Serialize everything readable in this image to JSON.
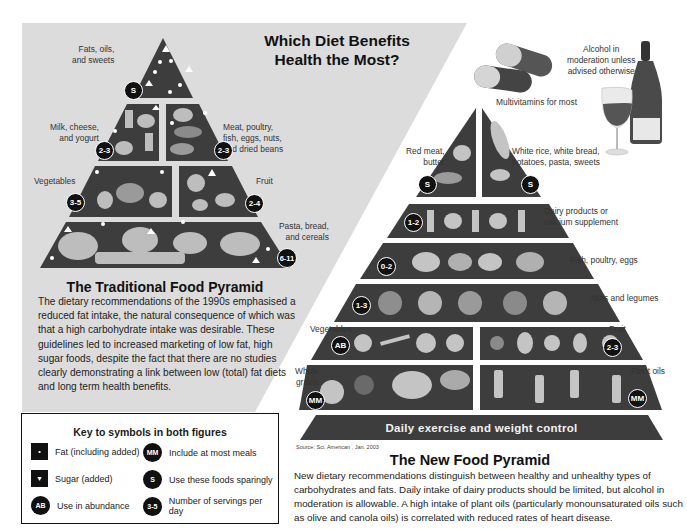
{
  "title": "Which Diet Benefits Health the Most?",
  "title_lines": [
    "Which Diet Benefits",
    "Health the Most?"
  ],
  "traditional": {
    "heading": "The Traditional Food Pyramid",
    "description": "The dietary recommendations of the 1990s emphasised a reduced fat intake, the natural consequence of which was that a high carbohydrate intake was desirable. These guidelines led to increased marketing of low fat, high sugar foods, despite the fact that there are no studies clearly demonstrating a link between low (total) fat diets and long term health benefits.",
    "tiers": [
      {
        "label": "Fats, oils,\nand sweets",
        "badge": "S"
      },
      {
        "label": "Milk, cheese,\nand yogurt",
        "badge": "2-3"
      },
      {
        "label": "Meat, poultry,\nfish, eggs, nuts,\nand dried beans",
        "badge": "2-3"
      },
      {
        "label": "Vegetables",
        "badge": "3-5"
      },
      {
        "label": "Fruit",
        "badge": "2-4"
      },
      {
        "label": "Pasta, bread,\nand cereals",
        "badge": "6-11"
      }
    ]
  },
  "new": {
    "heading": "The New Food Pyramid",
    "description": "New dietary recommendations distinguish between healthy and unhealthy types of carbohydrates and fats. Daily intake of dairy products should be limited, but alcohol in moderation is allowable. A high intake of plant oils (particularly monounsaturated oils such as olive and canola oils) is correlated with reduced rates of heart disease.",
    "extras": {
      "multivitamins": "Multivitamins for most",
      "alcohol": "Alcohol in\nmoderation unless\nadvised otherwise"
    },
    "tiers": [
      {
        "label": "Red meat,\nbutter",
        "badge": "S"
      },
      {
        "label": "White rice, white bread,\npotatoes, pasta, sweets",
        "badge": "S"
      },
      {
        "label": "Dairy products or\ncalcium supplement",
        "badge": "1-2"
      },
      {
        "label": "Fish, poultry, eggs",
        "badge": "0-2"
      },
      {
        "label": "Nuts and legumes",
        "badge": "1-3"
      },
      {
        "label": "Vegetables",
        "badge": "AB"
      },
      {
        "label": "Fruit",
        "badge": "2-3"
      },
      {
        "label": "Whole\ngrains",
        "badge": "MM"
      },
      {
        "label": "Plant oils",
        "badge": "MM"
      }
    ],
    "base": "Daily exercise and weight control",
    "source": "Source: Sci. American , Jan. 2003"
  },
  "key": {
    "title": "Key to symbols in both figures",
    "items": [
      {
        "symbol": "•",
        "shape": "square",
        "text": "Fat (including added)"
      },
      {
        "symbol": "▼",
        "shape": "square",
        "text": "Sugar (added)"
      },
      {
        "symbol": "AB",
        "shape": "circle",
        "text": "Use in abundance"
      },
      {
        "symbol": "MM",
        "shape": "circle",
        "text": "Include at most meals"
      },
      {
        "symbol": "S",
        "shape": "circle",
        "text": "Use these foods sparingly"
      },
      {
        "symbol": "3-5",
        "shape": "circle",
        "text": "Number of servings per day"
      }
    ]
  },
  "colors": {
    "panel_gray": "#d9d9d9",
    "tier_dark": "#3a3a3a",
    "badge": "#111111",
    "text": "#1a1a1a"
  }
}
